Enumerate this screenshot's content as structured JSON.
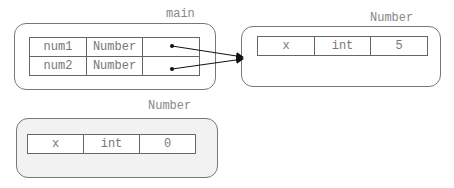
{
  "frames": {
    "main": {
      "label": "main",
      "rows": [
        {
          "name": "num1",
          "type": "Number",
          "value": ""
        },
        {
          "name": "num2",
          "type": "Number",
          "value": ""
        }
      ]
    },
    "number_object_1": {
      "label": "Number",
      "rows": [
        {
          "name": "x",
          "type": "int",
          "value": "5"
        }
      ]
    },
    "number_object_2": {
      "label": "Number",
      "rows": [
        {
          "name": "x",
          "type": "int",
          "value": "0"
        }
      ]
    }
  },
  "colors": {
    "border": "#777777",
    "text": "#777777",
    "garbage_bg": "#f2f2f2"
  }
}
